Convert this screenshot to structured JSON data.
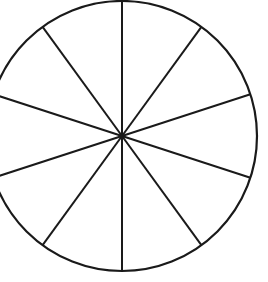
{
  "diagram": {
    "type": "circle-divided-into-equal-sectors",
    "sectors": 10,
    "center": [
      122,
      136
    ],
    "radius": 135,
    "stroke_color": "#1a1a1a",
    "background_color": "#ffffff",
    "spoke_angles_deg": [
      0,
      36,
      72,
      108,
      144,
      180,
      216,
      252,
      288,
      324
    ]
  }
}
